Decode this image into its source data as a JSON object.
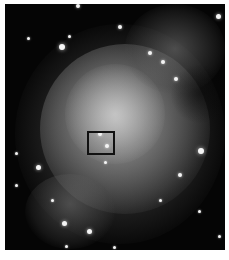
{
  "image": {
    "subject": "nebula",
    "colors": {
      "background": "#050505",
      "nebula_core": "#c8c8c8",
      "nebula_mid": "#8a8a8a",
      "nebula_outer": "#3c3c3c",
      "box": "#111111",
      "margin": "#ffffff"
    },
    "highlight_box": {
      "x": 87,
      "y": 131,
      "width": 28,
      "height": 24
    },
    "stars": [
      {
        "x": 78,
        "y": 6,
        "r": 2
      },
      {
        "x": 218,
        "y": 16,
        "r": 2.5
      },
      {
        "x": 120,
        "y": 27,
        "r": 2
      },
      {
        "x": 62,
        "y": 47,
        "r": 3
      },
      {
        "x": 28,
        "y": 38,
        "r": 1.5
      },
      {
        "x": 69,
        "y": 36,
        "r": 1.5
      },
      {
        "x": 150,
        "y": 53,
        "r": 2
      },
      {
        "x": 163,
        "y": 62,
        "r": 2
      },
      {
        "x": 176,
        "y": 79,
        "r": 2
      },
      {
        "x": 100,
        "y": 134,
        "r": 2
      },
      {
        "x": 107,
        "y": 146,
        "r": 2
      },
      {
        "x": 105,
        "y": 162,
        "r": 1.5
      },
      {
        "x": 201,
        "y": 151,
        "r": 3
      },
      {
        "x": 38,
        "y": 167,
        "r": 2.5
      },
      {
        "x": 16,
        "y": 153,
        "r": 1.5
      },
      {
        "x": 16,
        "y": 185,
        "r": 1.5
      },
      {
        "x": 180,
        "y": 175,
        "r": 2
      },
      {
        "x": 160,
        "y": 200,
        "r": 1.5
      },
      {
        "x": 199,
        "y": 211,
        "r": 1.5
      },
      {
        "x": 64,
        "y": 223,
        "r": 2.5
      },
      {
        "x": 89,
        "y": 231,
        "r": 2.5
      },
      {
        "x": 66,
        "y": 246,
        "r": 1.5
      },
      {
        "x": 219,
        "y": 236,
        "r": 1.5
      },
      {
        "x": 52,
        "y": 200,
        "r": 1.5
      },
      {
        "x": 114,
        "y": 247,
        "r": 1.5
      }
    ]
  }
}
